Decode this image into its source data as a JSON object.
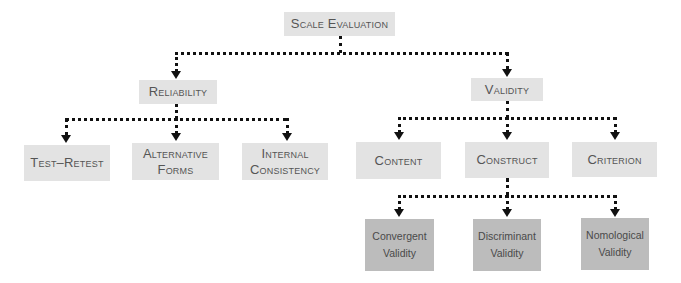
{
  "diagram": {
    "root": {
      "label": "Scale Evaluation"
    },
    "level1": [
      {
        "label": "Reliability"
      },
      {
        "label": "Validity"
      }
    ],
    "reliability_children": [
      {
        "label": "Test–Retest"
      },
      {
        "label_line1": "Alternative",
        "label_line2": "Forms"
      },
      {
        "label_line1": "Internal",
        "label_line2": "Consistency"
      }
    ],
    "validity_children": [
      {
        "label": "Content"
      },
      {
        "label": "Construct"
      },
      {
        "label": "Criterion"
      }
    ],
    "construct_children": [
      {
        "label_line1": "Convergent",
        "label_line2": "Validity"
      },
      {
        "label_line1": "Discriminant",
        "label_line2": "Validity"
      },
      {
        "label_line1": "Nomological",
        "label_line2": "Validity"
      }
    ],
    "colors": {
      "box_light": "#e3e3e3",
      "box_dark": "#bcbcbc",
      "connector": "#111111",
      "text": "#555555"
    }
  }
}
